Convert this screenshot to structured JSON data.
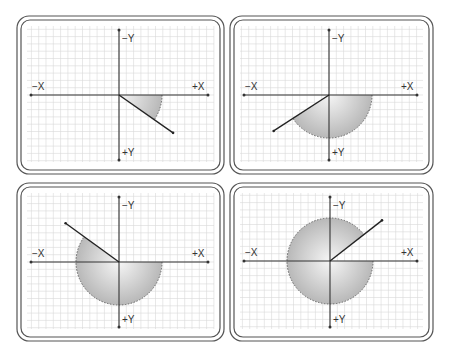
{
  "diagram": {
    "axis_labels": {
      "neg_x": "−X",
      "pos_x": "+X",
      "neg_y": "−Y",
      "pos_y": "+Y"
    },
    "colors": {
      "frame": "#555555",
      "grid": "#d9d9d9",
      "axis": "#333333",
      "ray": "#222222",
      "sector_fill_inner": "#f4f4f4",
      "sector_fill_outer": "#bdbdbd",
      "sector_edge": "#666666"
    },
    "panels": [
      {
        "id": "panel-1",
        "angle_deg": 35,
        "origin": [
          119,
          95
        ],
        "frame": [
          17,
          16,
          207,
          158
        ]
      },
      {
        "id": "panel-2",
        "angle_deg": 147,
        "origin": [
          329,
          95
        ],
        "frame": [
          230,
          16,
          203,
          158
        ]
      },
      {
        "id": "panel-3",
        "angle_deg": 216,
        "origin": [
          119,
          262
        ],
        "frame": [
          17,
          183,
          207,
          158
        ]
      },
      {
        "id": "panel-4",
        "angle_deg": 322,
        "origin": [
          330,
          261
        ],
        "frame": [
          230,
          183,
          203,
          158
        ]
      }
    ],
    "sector_radius": 43,
    "ray_length": 66,
    "grid_spacing": 7.3
  }
}
